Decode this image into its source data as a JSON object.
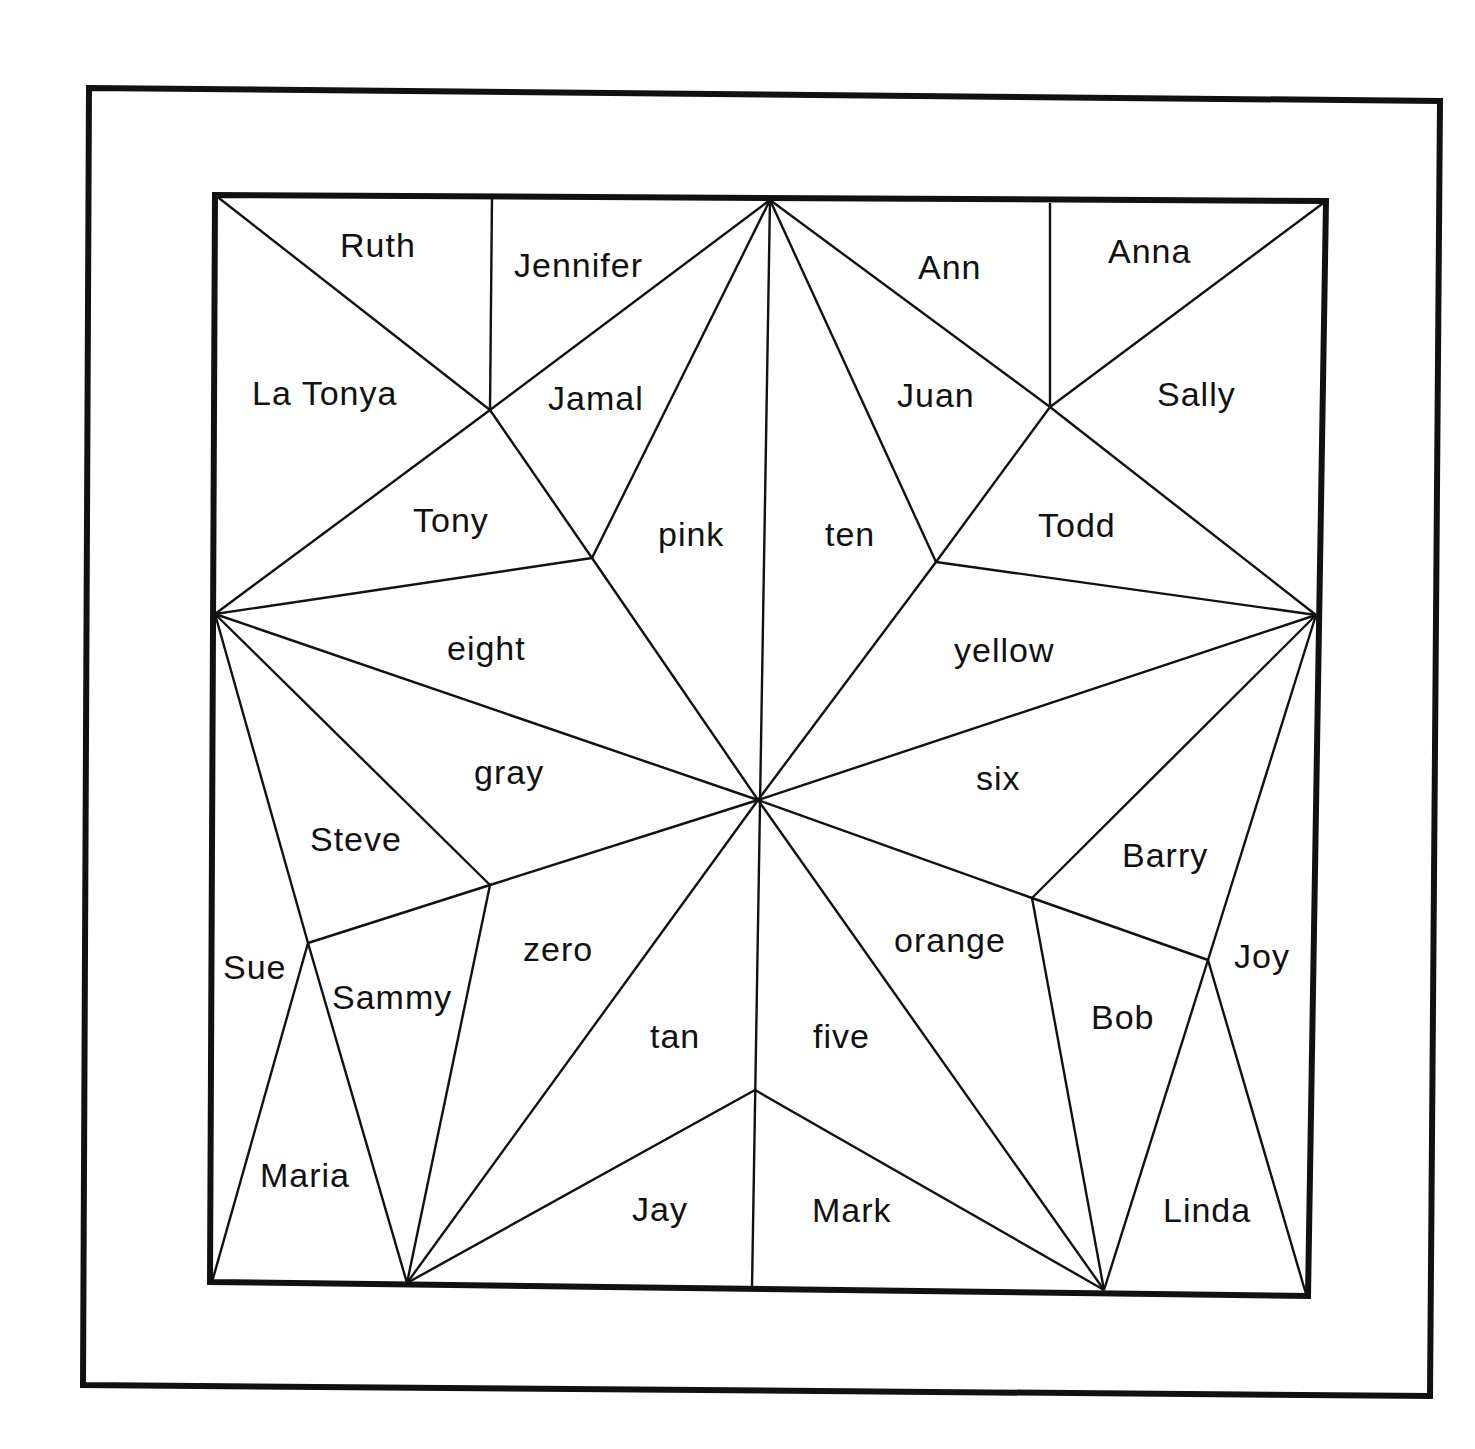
{
  "diagram": {
    "type": "quilt-star-puzzle",
    "labels": {
      "ruth": "Ruth",
      "jennifer": "Jennifer",
      "ann": "Ann",
      "anna": "Anna",
      "la_tonya": "La Tonya",
      "jamal": "Jamal",
      "juan": "Juan",
      "sally": "Sally",
      "tony": "Tony",
      "pink": "pink",
      "ten": "ten",
      "todd": "Todd",
      "eight": "eight",
      "yellow": "yellow",
      "gray": "gray",
      "six": "six",
      "steve": "Steve",
      "barry": "Barry",
      "sue": "Sue",
      "sammy": "Sammy",
      "zero": "zero",
      "orange": "orange",
      "joy": "Joy",
      "tan": "tan",
      "five": "five",
      "bob": "Bob",
      "maria": "Maria",
      "jay": "Jay",
      "mark": "Mark",
      "linda": "Linda"
    },
    "colors": {
      "line": "#111111",
      "background": "#ffffff"
    }
  }
}
